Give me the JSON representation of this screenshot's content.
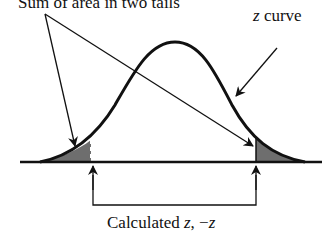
{
  "diagram": {
    "title": "Sum of area in two tails",
    "curve_label_var": "z",
    "curve_label_rest": " curve",
    "bottom_label_text": "Calculated ",
    "bottom_label_z": "z",
    "bottom_label_sep": ", −",
    "bottom_label_negz": "z",
    "colors": {
      "line": "#111111",
      "tail_fill": "#6e6e6e",
      "background": "#ffffff"
    }
  }
}
